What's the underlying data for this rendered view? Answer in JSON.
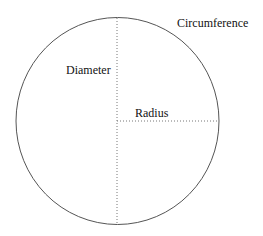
{
  "diagram": {
    "labels": {
      "circumference": "Circumference",
      "diameter": "Diameter",
      "radius": "Radius"
    },
    "colors": {
      "stroke": "#555555",
      "dotted": "#777777",
      "text": "#111111"
    }
  }
}
